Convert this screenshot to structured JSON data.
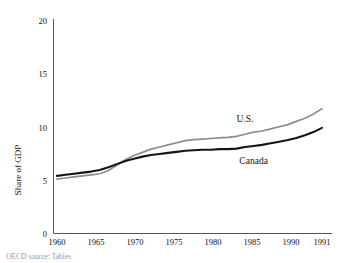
{
  "chart_data": {
    "type": "line",
    "title": "",
    "xlabel": "",
    "ylabel": "Share of GDP",
    "xlim": [
      1960,
      1991
    ],
    "ylim": [
      0,
      20
    ],
    "yticks": [
      0,
      5,
      10,
      15,
      20
    ],
    "xticks": [
      1960,
      1965,
      1970,
      1975,
      1980,
      1985,
      1990,
      1991
    ],
    "grid": false,
    "legend": "inline-annotations",
    "x": [
      1960,
      1961,
      1962,
      1963,
      1964,
      1965,
      1966,
      1967,
      1968,
      1969,
      1970,
      1971,
      1972,
      1973,
      1974,
      1975,
      1976,
      1977,
      1978,
      1979,
      1980,
      1981,
      1982,
      1983,
      1984,
      1985,
      1986,
      1987,
      1988,
      1989,
      1990,
      1991
    ],
    "series": [
      {
        "name": "U.S.",
        "color": "#8c8c8c",
        "values": [
          5.1,
          5.2,
          5.3,
          5.4,
          5.5,
          5.6,
          5.9,
          6.4,
          6.9,
          7.3,
          7.6,
          7.9,
          8.1,
          8.3,
          8.5,
          8.7,
          8.8,
          8.85,
          8.9,
          8.95,
          9.0,
          9.1,
          9.3,
          9.5,
          9.6,
          9.8,
          10.0,
          10.2,
          10.5,
          10.8,
          11.2,
          11.7
        ]
      },
      {
        "name": "Canada",
        "color": "#151515",
        "values": [
          5.4,
          5.5,
          5.6,
          5.7,
          5.8,
          5.95,
          6.2,
          6.5,
          6.8,
          7.0,
          7.2,
          7.35,
          7.45,
          7.55,
          7.65,
          7.75,
          7.8,
          7.85,
          7.85,
          7.9,
          7.9,
          7.95,
          8.1,
          8.2,
          8.3,
          8.45,
          8.6,
          8.75,
          8.95,
          9.2,
          9.5,
          9.9
        ]
      }
    ],
    "annotations": [
      {
        "text": "U.S.",
        "x": 1982,
        "y": 10.4
      },
      {
        "text": "Canada",
        "x": 1983,
        "y": 6.5
      }
    ]
  },
  "axis": {
    "ytick_labels": [
      "0",
      "5",
      "10",
      "15",
      "20"
    ],
    "xtick_labels": [
      "1960",
      "1965",
      "1970",
      "1975",
      "1980",
      "1985",
      "1990",
      "1991"
    ],
    "y_title": "Share of GDP"
  },
  "footer": {
    "source_note": "OECD source: Tables"
  },
  "colors": {
    "us_line": "#8c8c8c",
    "canada_line": "#151515",
    "axis": "#555555",
    "background": "#ffffff"
  }
}
